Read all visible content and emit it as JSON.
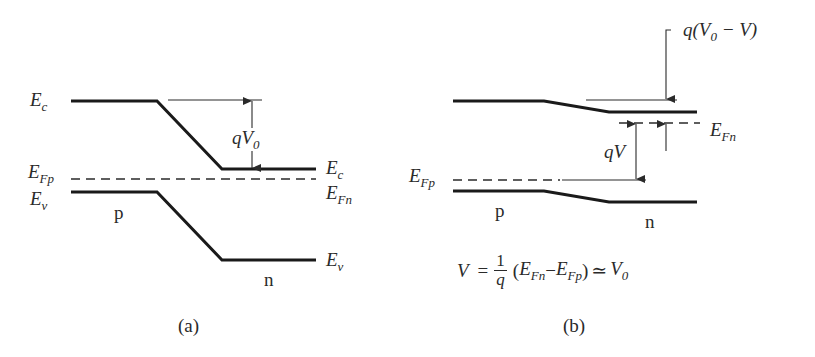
{
  "figure": {
    "panel_a": {
      "caption": "(a)",
      "labels": {
        "ec_left": {
          "base": "E",
          "sub": "c"
        },
        "ec_right": {
          "base": "E",
          "sub": "c"
        },
        "efp": {
          "base": "E",
          "sub": "Fp"
        },
        "efn": {
          "base": "E",
          "sub": "Fn"
        },
        "ev_left": {
          "base": "E",
          "sub": "v"
        },
        "ev_right": {
          "base": "E",
          "sub": "v"
        },
        "barrier": {
          "base": "qV",
          "sub": "0"
        },
        "p_region": "p",
        "n_region": "n"
      }
    },
    "panel_b": {
      "caption": "(b)",
      "labels": {
        "barrier": {
          "prefix": "q(V",
          "sub": "0",
          "suffix": " − V)"
        },
        "efn": {
          "base": "E",
          "sub": "Fn"
        },
        "efp": {
          "base": "E",
          "sub": "Fp"
        },
        "qv": "qV",
        "p_region": "p",
        "n_region": "n"
      },
      "equation": {
        "lhs": "V",
        "equals": "=",
        "frac_num": "1",
        "frac_den": "q",
        "open": "(",
        "term1": {
          "base": "E",
          "sub": "Fn"
        },
        "minus": "−",
        "term2": {
          "base": "E",
          "sub": "Fp"
        },
        "close": ")",
        "approx": "≃",
        "rhs": {
          "base": "V",
          "sub": "0"
        }
      }
    },
    "colors": {
      "line": "#1a1a1a",
      "text": "#2a2a2a",
      "background": "#ffffff"
    }
  }
}
